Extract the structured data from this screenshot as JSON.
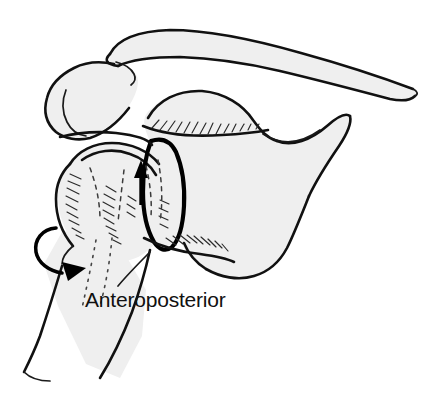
{
  "figure": {
    "title": "Anteroposterior",
    "caption": "Anteroposterior",
    "view_label": "Anteroposterior",
    "width": 433,
    "height": 404,
    "background_color": "#ffffff",
    "bone_fill_color": "#efefef",
    "outline_color": "#111111",
    "arrow_color": "#000000"
  },
  "structures": [
    {
      "id": "clavicle",
      "label": "Clavicle"
    },
    {
      "id": "acromion",
      "label": "Acromion"
    },
    {
      "id": "coracoid",
      "label": "Coracoid process"
    },
    {
      "id": "humeral-head",
      "label": "Humeral head"
    },
    {
      "id": "humerus-shaft",
      "label": "Humerus shaft"
    },
    {
      "id": "glenoid",
      "label": "Glenoid"
    },
    {
      "id": "scapula-body",
      "label": "Scapula body"
    }
  ],
  "annotations": {
    "superior_arrow": {
      "id": "superior-arrow",
      "direction": "up",
      "meaning": "superior translation"
    },
    "rotation_arrow": {
      "id": "rotation-arrow",
      "direction": "curved-clockwise",
      "meaning": "humeral rotation"
    }
  }
}
